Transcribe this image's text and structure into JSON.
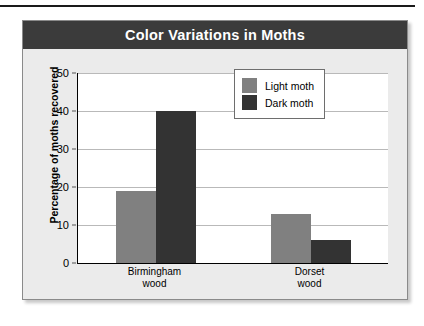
{
  "chart_data": {
    "type": "bar",
    "title": "Color Variations in Moths",
    "xlabel": "",
    "ylabel": "Percentage of moths recovered",
    "ylim": [
      0,
      50
    ],
    "yticks": [
      0,
      10,
      20,
      30,
      40,
      50
    ],
    "grid": true,
    "legend_position": "top-right",
    "categories": [
      "Birmingham\nwood",
      "Dorset\nwood"
    ],
    "category_lines": [
      [
        "Birmingham",
        "wood"
      ],
      [
        "Dorset",
        "wood"
      ]
    ],
    "series": [
      {
        "name": "Light moth",
        "color": "#808080",
        "values": [
          19,
          13
        ]
      },
      {
        "name": "Dark moth",
        "color": "#333333",
        "values": [
          40,
          6
        ]
      }
    ]
  },
  "panel": {
    "title_bar_color": "#3b3b3b",
    "background_color": "#ebebeb",
    "plot_background_color": "#ffffff",
    "gridline_color": "#b9b9b9"
  }
}
